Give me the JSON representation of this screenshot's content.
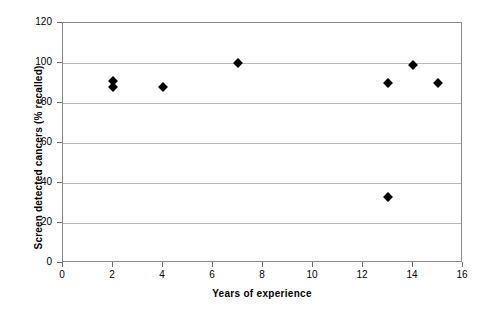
{
  "chart_data": {
    "type": "scatter",
    "title": "",
    "xlabel": "Years of experience",
    "ylabel": "Screen detected cancers (% recalled)",
    "xlim": [
      0,
      16
    ],
    "ylim": [
      0,
      120
    ],
    "xticks": [
      0,
      2,
      4,
      6,
      8,
      10,
      12,
      14,
      16
    ],
    "yticks": [
      0,
      20,
      40,
      60,
      80,
      100,
      120
    ],
    "grid": "horizontal",
    "legend": "none",
    "marker": "diamond",
    "marker_color": "#000000",
    "points": [
      {
        "x": 2,
        "y": 91
      },
      {
        "x": 2,
        "y": 88
      },
      {
        "x": 4,
        "y": 88
      },
      {
        "x": 7,
        "y": 100
      },
      {
        "x": 13,
        "y": 90
      },
      {
        "x": 13,
        "y": 33
      },
      {
        "x": 14,
        "y": 99
      },
      {
        "x": 15,
        "y": 90
      }
    ]
  },
  "colors": {
    "grid": "#b9b9b9",
    "frame": "#8a8a8a",
    "marker": "#000000",
    "background": "#ffffff"
  }
}
